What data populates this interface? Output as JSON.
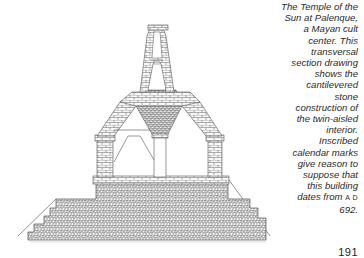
{
  "figure": {
    "colors": {
      "line": "#555555",
      "stone_fill": "#f4f4f4",
      "background": "#ffffff"
    }
  },
  "caption": {
    "lines": [
      "The Temple of the",
      "Sun at Palenque,",
      "a Mayan cult",
      "center. This",
      "transversal",
      "section drawing",
      "shows the",
      "cantilevered",
      "stone",
      "construction of",
      "the twin-aisled",
      "interior.",
      "Inscribed",
      "calendar marks",
      "give reason to",
      "suppose that",
      "this building",
      "dates from"
    ],
    "era": "A D",
    "year": "692."
  },
  "page": {
    "number": "191"
  }
}
